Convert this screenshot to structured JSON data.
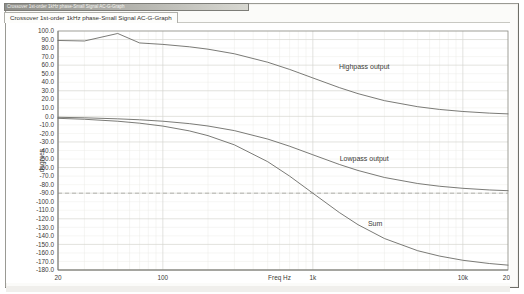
{
  "window": {
    "title": "Crossover 1st-order 1kHz phase-Small Signal AC-G-Graph"
  },
  "tabs": [
    {
      "label": "Crossover 1st-order 1kHz phase-Small Signal AC-G-Graph",
      "active": true
    }
  ],
  "chart_data": {
    "type": "line",
    "title": "",
    "xlabel": "Freq Hz",
    "ylabel": "degrees",
    "xscale": "log",
    "xlim": [
      20,
      20000
    ],
    "ylim": [
      -180,
      100
    ],
    "ytick_step": 10,
    "grid": true,
    "legend": "inline-annotations",
    "xticks": [
      {
        "value": 20,
        "label": "20"
      },
      {
        "value": 100,
        "label": "100"
      },
      {
        "value": 1000,
        "label": "1k"
      },
      {
        "value": 10000,
        "label": "10k"
      },
      {
        "value": 20000,
        "label": "20k"
      }
    ],
    "yticks": [
      "100.0",
      "90.0",
      "80.0",
      "70.0",
      "60.0",
      "50.0",
      "40.0",
      "30.0",
      "20.0",
      "10.0",
      "0.0",
      "-10.0",
      "-20.0",
      "-30.0",
      "-40.0",
      "-50.0",
      "-60.0",
      "-70.0",
      "-80.0",
      "-90.0",
      "-100.0",
      "-110.0",
      "-120.0",
      "-130.0",
      "-140.0",
      "-150.0",
      "-160.0",
      "-170.0",
      "-180.0"
    ],
    "reference_lines": [
      {
        "value": -90,
        "style": "dashed"
      }
    ],
    "crossover_frequency_hz": 1000,
    "series": [
      {
        "name": "Highpass output",
        "curve": "highpass-phase",
        "color": "#6b6b66",
        "annotation": {
          "text": "Highpass output",
          "x_hz": 2200,
          "y_deg": 55
        },
        "points": [
          [
            20,
            88.9
          ],
          [
            30,
            88.3
          ],
          [
            50,
            97.1
          ],
          [
            70,
            86.0
          ],
          [
            100,
            84.3
          ],
          [
            150,
            81.5
          ],
          [
            200,
            78.7
          ],
          [
            300,
            73.3
          ],
          [
            500,
            63.4
          ],
          [
            700,
            55.0
          ],
          [
            1000,
            45.0
          ],
          [
            1500,
            33.7
          ],
          [
            2000,
            26.6
          ],
          [
            3000,
            18.4
          ],
          [
            5000,
            11.3
          ],
          [
            7000,
            8.1
          ],
          [
            10000,
            5.7
          ],
          [
            15000,
            3.8
          ],
          [
            20000,
            2.9
          ]
        ]
      },
      {
        "name": "Lowpass output",
        "curve": "lowpass-phase",
        "color": "#6b6b66",
        "annotation": {
          "text": "Lowpass output",
          "x_hz": 2200,
          "y_deg": -52
        },
        "points": [
          [
            20,
            -1.1
          ],
          [
            30,
            -1.7
          ],
          [
            50,
            -2.9
          ],
          [
            70,
            -4.0
          ],
          [
            100,
            -5.7
          ],
          [
            150,
            -8.5
          ],
          [
            200,
            -11.3
          ],
          [
            300,
            -16.7
          ],
          [
            500,
            -26.6
          ],
          [
            700,
            -35.0
          ],
          [
            1000,
            -45.0
          ],
          [
            1500,
            -56.3
          ],
          [
            2000,
            -63.4
          ],
          [
            3000,
            -71.6
          ],
          [
            5000,
            -78.7
          ],
          [
            7000,
            -81.9
          ],
          [
            10000,
            -84.3
          ],
          [
            15000,
            -86.2
          ],
          [
            20000,
            -87.1
          ]
        ]
      },
      {
        "name": "Sum",
        "curve": "sum-phase",
        "color": "#6b6b66",
        "annotation": {
          "text": "Sum",
          "x_hz": 2600,
          "y_deg": -128
        },
        "points": [
          [
            20,
            -2.3
          ],
          [
            30,
            -3.4
          ],
          [
            50,
            -5.7
          ],
          [
            70,
            -8.0
          ],
          [
            100,
            -11.4
          ],
          [
            150,
            -17.0
          ],
          [
            200,
            -22.6
          ],
          [
            300,
            -33.4
          ],
          [
            500,
            -53.1
          ],
          [
            700,
            -70.0
          ],
          [
            1000,
            -90.0
          ],
          [
            1500,
            -112.6
          ],
          [
            2000,
            -126.9
          ],
          [
            3000,
            -143.1
          ],
          [
            5000,
            -157.4
          ],
          [
            7000,
            -163.7
          ],
          [
            10000,
            -168.6
          ],
          [
            15000,
            -172.4
          ],
          [
            20000,
            -174.3
          ]
        ]
      }
    ]
  },
  "colors": {
    "grid_major": "#d6d6d0",
    "grid_minor": "#eaeae6",
    "axis": "#8e8e88",
    "curve": "#6b6b66",
    "text": "#3a3a36",
    "frame": "#9a9a94"
  }
}
